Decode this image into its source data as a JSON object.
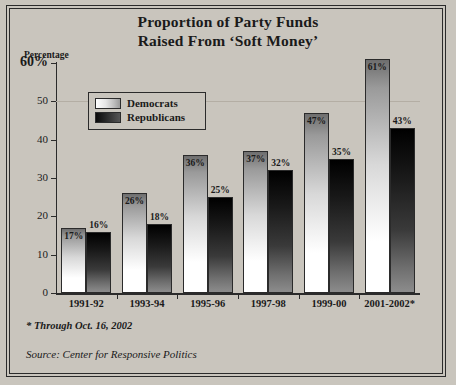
{
  "chart_data": {
    "type": "bar",
    "title": "Proportion of Party Funds Raised From ‘Soft Money’",
    "title_line1": "Proportion of Party Funds",
    "title_line2": "Raised From ‘Soft Money’",
    "ylabel": "Percentage",
    "xlabel": "",
    "ylim": [
      0,
      60
    ],
    "yticks": [
      "0",
      "10",
      "20",
      "30",
      "40",
      "50",
      "60%"
    ],
    "ytick_values": [
      0,
      10,
      20,
      30,
      40,
      50,
      60
    ],
    "grid": true,
    "legend_position": "upper left inside",
    "categories": [
      "1991-92",
      "1993-94",
      "1995-96",
      "1997-98",
      "1999-00",
      "2001-2002*"
    ],
    "series": [
      {
        "name": "Democrats",
        "values": [
          17,
          26,
          36,
          37,
          47,
          61
        ],
        "labels": [
          "17%",
          "26%",
          "36%",
          "37%",
          "47%",
          "61%"
        ]
      },
      {
        "name": "Republicans",
        "values": [
          16,
          18,
          25,
          32,
          35,
          43
        ],
        "labels": [
          "16%",
          "18%",
          "25%",
          "32%",
          "35%",
          "43%"
        ]
      }
    ],
    "footnote": "* Through Oct. 16, 2002",
    "source": "Source: Center for Responsive Politics",
    "colors": {
      "background": "#c9c5bd",
      "axis": "#2b2b2b",
      "gridline": "#b4aea4",
      "democrats_bar": "#ffffff",
      "republicans_bar": "#1a1a1a",
      "text": "#1a1a1a"
    }
  }
}
